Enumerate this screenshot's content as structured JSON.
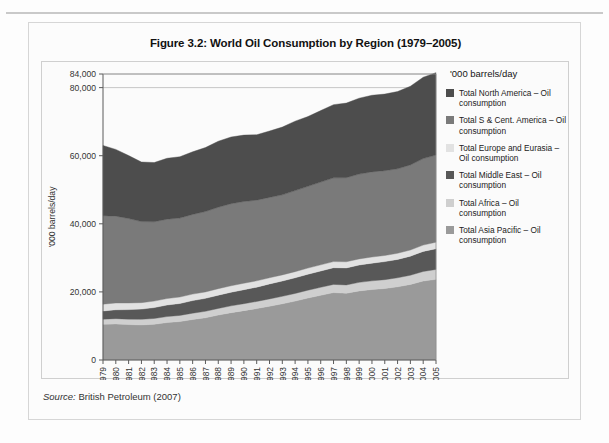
{
  "figure": {
    "title": "Figure 3.2: World Oil Consumption by Region (1979–2005)",
    "source_keyword": "Source:",
    "source_text": " British Petroleum (2007)"
  },
  "legend": {
    "title": "'000 barrels/day",
    "items": [
      {
        "label": "Total North America – Oil consumption",
        "color": "#4d4d4d"
      },
      {
        "label": "Total S & Cent. America – Oil consumption",
        "color": "#7a7a7a"
      },
      {
        "label": "Total Europe and Eurasia – Oil consumption",
        "color": "#e2e2e2"
      },
      {
        "label": "Total Middle East – Oil consumption",
        "color": "#585858"
      },
      {
        "label": "Total Africa – Oil consumption",
        "color": "#cfcfcf"
      },
      {
        "label": "Total Asia Pacific – Oil consumption",
        "color": "#9a9a9a"
      }
    ]
  },
  "chart_data": {
    "type": "area",
    "stacked": true,
    "title": "Figure 3.2: World Oil Consumption by Region (1979–2005)",
    "xlabel": "",
    "ylabel": "'000 barrels/day",
    "ylim": [
      0,
      84000
    ],
    "yticks": [
      0,
      20000,
      40000,
      60000,
      80000,
      84000
    ],
    "ytick_labels": [
      "0",
      "20,000",
      "40,000",
      "60,000",
      "80,000",
      "84,000"
    ],
    "gridlines": [
      80000,
      84000
    ],
    "legend_position": "right",
    "x": [
      1979,
      1980,
      1981,
      1982,
      1983,
      1984,
      1985,
      1986,
      1987,
      1988,
      1989,
      1990,
      1991,
      1992,
      1993,
      1994,
      1995,
      1996,
      1997,
      1998,
      1999,
      2000,
      2001,
      2002,
      2003,
      2004,
      2005
    ],
    "categories": [
      "1979",
      "1980",
      "1981",
      "1982",
      "1983",
      "1984",
      "1985",
      "1986",
      "1987",
      "1988",
      "1989",
      "1990",
      "1991",
      "1992",
      "1993",
      "1994",
      "1995",
      "1996",
      "1997",
      "1998",
      "1999",
      "2000",
      "2001",
      "2002",
      "2003",
      "2004",
      "2005"
    ],
    "series": [
      {
        "name": "Total Asia Pacific – Oil consumption",
        "color": "#9a9a9a",
        "values": [
          10500,
          10600,
          10400,
          10300,
          10500,
          11000,
          11300,
          11900,
          12400,
          13200,
          13900,
          14500,
          15100,
          15800,
          16500,
          17300,
          18200,
          19000,
          19800,
          19600,
          20300,
          20700,
          21000,
          21500,
          22200,
          23200,
          23700
        ]
      },
      {
        "name": "Total Africa – Oil consumption",
        "color": "#cfcfcf",
        "values": [
          1500,
          1550,
          1600,
          1650,
          1700,
          1750,
          1800,
          1850,
          1900,
          1950,
          2000,
          2050,
          2100,
          2150,
          2200,
          2250,
          2300,
          2350,
          2400,
          2450,
          2500,
          2550,
          2600,
          2650,
          2700,
          2800,
          2900
        ]
      },
      {
        "name": "Total Middle East – Oil consumption",
        "color": "#585858",
        "values": [
          2400,
          2600,
          2800,
          3000,
          3200,
          3400,
          3500,
          3700,
          3800,
          3900,
          4000,
          4100,
          4200,
          4400,
          4500,
          4600,
          4700,
          4800,
          4900,
          5000,
          5100,
          5200,
          5300,
          5400,
          5600,
          5900,
          6100
        ]
      },
      {
        "name": "Total Europe and Eurasia – Oil consumption",
        "color": "#e2e2e2",
        "values": [
          2000,
          2000,
          1950,
          1900,
          1900,
          1900,
          1900,
          1900,
          1900,
          1900,
          1900,
          1900,
          1850,
          1800,
          1800,
          1800,
          1800,
          1800,
          1800,
          1800,
          1800,
          1800,
          1800,
          1800,
          1800,
          1850,
          1900
        ]
      },
      {
        "name": "Total S & Cent. America – Oil consumption",
        "color": "#7a7a7a",
        "values": [
          26000,
          25500,
          24800,
          23800,
          23300,
          23300,
          23200,
          23400,
          23600,
          23900,
          24100,
          24000,
          23700,
          23600,
          23500,
          23800,
          24000,
          24300,
          24600,
          24700,
          24900,
          25000,
          24900,
          24800,
          25000,
          25400,
          25600
        ]
      },
      {
        "name": "Total North America – Oil consumption",
        "color": "#4d4d4d",
        "values": [
          20600,
          19600,
          18500,
          17500,
          17400,
          17900,
          18000,
          18400,
          18800,
          19400,
          19600,
          19500,
          19200,
          19500,
          19900,
          20400,
          20500,
          21000,
          21500,
          21900,
          22300,
          22500,
          22500,
          22700,
          23100,
          23900,
          24200
        ]
      }
    ]
  }
}
